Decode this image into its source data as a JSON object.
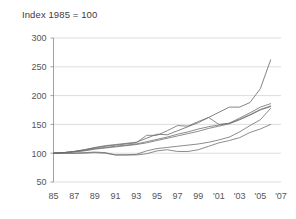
{
  "chart_data": {
    "type": "line",
    "title": "Index 1985 = 100",
    "xlabel": "",
    "ylabel": "",
    "xlim": [
      1985,
      2007
    ],
    "ylim": [
      50,
      300
    ],
    "ytick_values": [
      50,
      100,
      150,
      200,
      250,
      300
    ],
    "ytick_labels": [
      "50",
      "100",
      "150",
      "200",
      "250",
      "300"
    ],
    "xtick_values": [
      1985,
      1987,
      1989,
      1991,
      1993,
      1995,
      1997,
      1999,
      2001,
      2003,
      2005,
      2007
    ],
    "xtick_labels": [
      "85",
      "87",
      "89",
      "91",
      "93",
      "95",
      "97",
      "99",
      "'01",
      "'03",
      "'05",
      "'07"
    ],
    "grid": "horizontal",
    "legend": "none",
    "line_color": "#6e6e6e",
    "x": [
      1985,
      1986,
      1987,
      1988,
      1989,
      1990,
      1991,
      1992,
      1993,
      1994,
      1995,
      1996,
      1997,
      1998,
      1999,
      2000,
      2001,
      2002,
      2003,
      2004,
      2005,
      2006
    ],
    "series": [
      {
        "name": "series-1",
        "values": [
          100,
          101,
          103,
          106,
          110,
          113,
          115,
          117,
          119,
          126,
          133,
          132,
          139,
          146,
          153,
          162,
          171,
          180,
          180,
          188,
          212,
          262
        ]
      },
      {
        "name": "series-2",
        "values": [
          100,
          101,
          103,
          106,
          109,
          112,
          114,
          116,
          118,
          131,
          131,
          139,
          148,
          147,
          155,
          162,
          150,
          152,
          161,
          170,
          180,
          186
        ]
      },
      {
        "name": "series-3",
        "values": [
          100,
          101,
          103,
          105,
          108,
          110,
          112,
          114,
          116,
          120,
          124,
          128,
          133,
          137,
          142,
          146,
          149,
          152,
          159,
          167,
          176,
          182
        ]
      },
      {
        "name": "series-4",
        "values": [
          100,
          101,
          102,
          104,
          107,
          109,
          111,
          113,
          115,
          118,
          122,
          126,
          130,
          134,
          138,
          143,
          147,
          151,
          158,
          166,
          175,
          181
        ]
      },
      {
        "name": "series-5",
        "values": [
          100,
          100,
          100,
          100,
          101,
          100,
          97,
          97,
          98,
          104,
          108,
          110,
          112,
          114,
          116,
          119,
          123,
          128,
          137,
          148,
          158,
          178
        ]
      },
      {
        "name": "series-6",
        "values": [
          100,
          100,
          100,
          101,
          102,
          101,
          97,
          97,
          97,
          99,
          104,
          106,
          103,
          103,
          106,
          112,
          118,
          122,
          127,
          136,
          142,
          150
        ]
      }
    ]
  }
}
